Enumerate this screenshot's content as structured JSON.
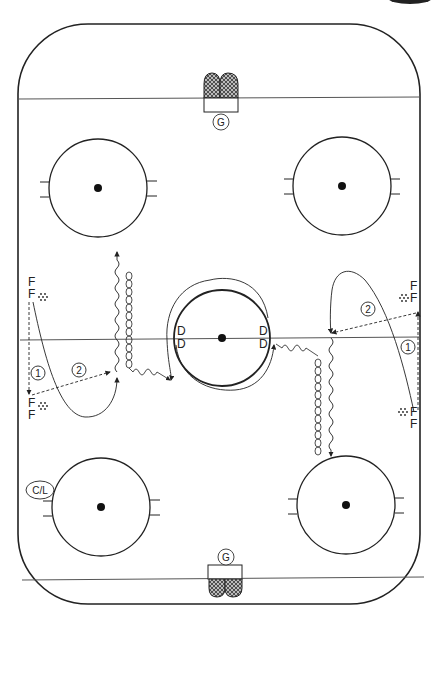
{
  "diagram": {
    "type": "hockey-drill",
    "rink": {
      "outline_color": "#222222",
      "line_color": "#444444",
      "dot_color": "#111111"
    },
    "labels": {
      "goalie_top": "G",
      "goalie_bottom": "G",
      "coach": "C/L",
      "defense": [
        "D",
        "D",
        "D",
        "D"
      ],
      "forwards_left": [
        "F",
        "F",
        "F",
        "F"
      ],
      "forwards_right": [
        "F",
        "F",
        "F",
        "F"
      ],
      "step_1_left": "1",
      "step_2_left": "2",
      "step_1_right": "1",
      "step_2_right": "2"
    },
    "legend": {
      "dashed_arrow": "pass",
      "solid_arrow": "skate",
      "wavy_line": "skate with puck",
      "loop_chain": "backward skating"
    }
  }
}
